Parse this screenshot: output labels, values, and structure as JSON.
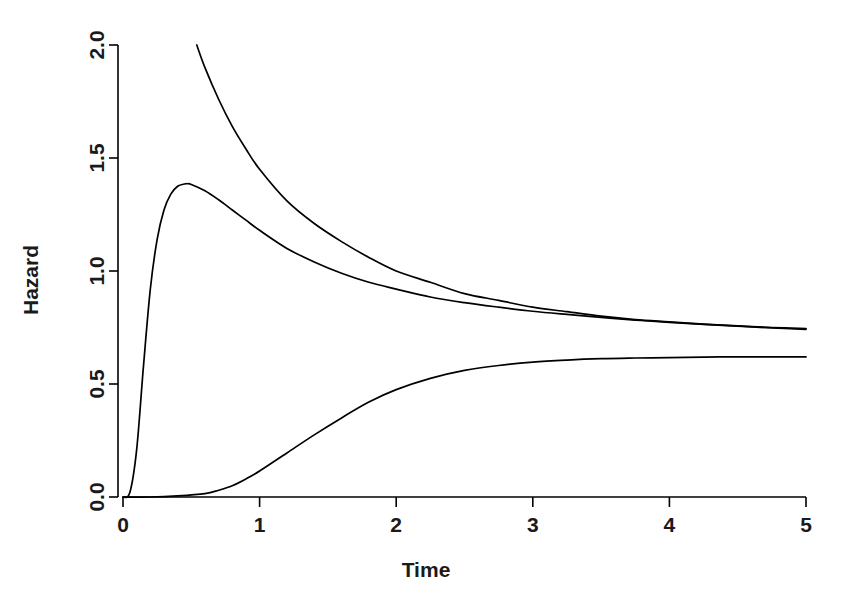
{
  "chart_data": {
    "type": "line",
    "title": "",
    "xlabel": "Time",
    "ylabel": "Hazard",
    "xlim": [
      0,
      5
    ],
    "ylim": [
      0,
      2
    ],
    "grid": false,
    "legend": "none",
    "background_color": "#ffffff",
    "line_color": "#000000",
    "x_ticks": [
      "0",
      "1",
      "2",
      "3",
      "4",
      "5"
    ],
    "x_tick_values": [
      0,
      1,
      2,
      3,
      4,
      5
    ],
    "y_ticks": [
      "0.0",
      "0.5",
      "1.0",
      "1.5",
      "2.0"
    ],
    "y_tick_values": [
      0.0,
      0.5,
      1.0,
      1.5,
      2.0
    ],
    "x": [
      0,
      0.05,
      0.1,
      0.15,
      0.2,
      0.25,
      0.3,
      0.35,
      0.4,
      0.45,
      0.5,
      0.54,
      0.6,
      0.7,
      0.8,
      0.9,
      1.0,
      1.2,
      1.4,
      1.6,
      1.8,
      2.0,
      2.25,
      2.5,
      2.75,
      3.0,
      3.25,
      3.5,
      3.75,
      4.0,
      4.25,
      4.5,
      4.75,
      5.0
    ],
    "series": [
      {
        "name": "decreasing-hazard",
        "description": "Monotone decreasing hazard entering plot at y=2.0",
        "x": [
          0.54,
          0.6,
          0.7,
          0.8,
          0.9,
          1.0,
          1.2,
          1.4,
          1.6,
          1.8,
          2.0,
          2.25,
          2.5,
          2.75,
          3.0,
          3.25,
          3.5,
          3.75,
          4.0,
          4.25,
          4.5,
          4.75,
          5.0
        ],
        "values": [
          2.0,
          1.9,
          1.76,
          1.64,
          1.54,
          1.45,
          1.31,
          1.21,
          1.13,
          1.06,
          1.0,
          0.95,
          0.9,
          0.87,
          0.84,
          0.82,
          0.8,
          0.785,
          0.775,
          0.765,
          0.757,
          0.75,
          0.745
        ]
      },
      {
        "name": "unimodal-hazard",
        "description": "Rises steeply from 0, peaks near t=0.47 at 1.38, then declines",
        "x": [
          0,
          0.05,
          0.1,
          0.15,
          0.2,
          0.25,
          0.3,
          0.35,
          0.4,
          0.45,
          0.47,
          0.5,
          0.6,
          0.7,
          0.8,
          0.9,
          1.0,
          1.2,
          1.4,
          1.6,
          1.8,
          2.0,
          2.25,
          2.5,
          2.75,
          3.0,
          3.25,
          3.5,
          3.75,
          4.0,
          4.25,
          4.5,
          4.75,
          5.0
        ],
        "values": [
          0.0,
          0.02,
          0.21,
          0.58,
          0.92,
          1.14,
          1.27,
          1.34,
          1.375,
          1.385,
          1.386,
          1.383,
          1.355,
          1.315,
          1.27,
          1.225,
          1.18,
          1.1,
          1.04,
          0.99,
          0.95,
          0.92,
          0.885,
          0.86,
          0.84,
          0.822,
          0.808,
          0.795,
          0.783,
          0.773,
          0.764,
          0.756,
          0.748,
          0.742
        ]
      },
      {
        "name": "increasing-hazard",
        "description": "Sigmoidal increase from 0 toward an asymptote near 0.62",
        "x": [
          0,
          0.2,
          0.4,
          0.6,
          0.7,
          0.8,
          0.9,
          1.0,
          1.2,
          1.4,
          1.6,
          1.8,
          2.0,
          2.25,
          2.5,
          2.75,
          3.0,
          3.25,
          3.5,
          3.75,
          4.0,
          4.25,
          4.5,
          4.75,
          5.0
        ],
        "values": [
          0.0,
          0.0,
          0.005,
          0.015,
          0.03,
          0.05,
          0.08,
          0.115,
          0.195,
          0.275,
          0.35,
          0.42,
          0.475,
          0.525,
          0.56,
          0.582,
          0.597,
          0.606,
          0.612,
          0.615,
          0.617,
          0.619,
          0.62,
          0.62,
          0.62
        ]
      }
    ]
  }
}
